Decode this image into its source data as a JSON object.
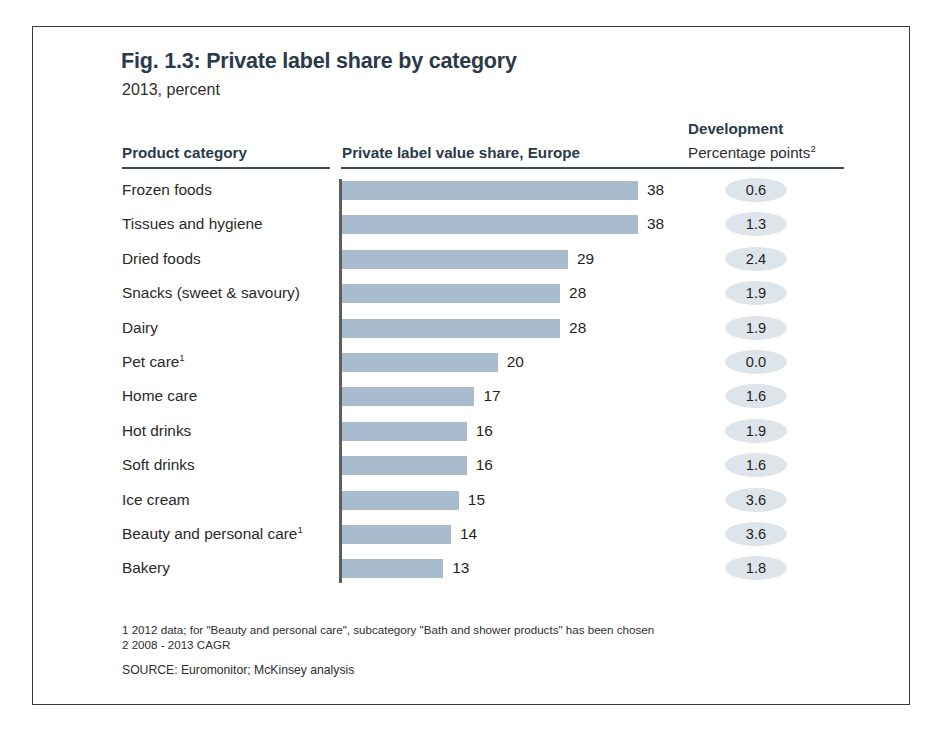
{
  "figure": {
    "title": "Fig. 1.3: Private label share by category",
    "subtitle": "2013, percent"
  },
  "headers": {
    "category": "Product category",
    "bars": "Private label value share, Europe",
    "development": "Development",
    "development_sub": "Percentage points",
    "development_sub_superscript": "2"
  },
  "footnotes": {
    "note1": "1 2012 data; for \"Beauty and personal care\", subcategory \"Bath and shower products\" has been chosen",
    "note2": "2 2008 - 2013 CAGR",
    "source": "SOURCE: Euromonitor; McKinsey analysis"
  },
  "colors": {
    "bar": "#a8bcce",
    "badge": "#dde4ea",
    "title": "#2b3a4a",
    "axis": "#5e5e5e",
    "frame": "#3a3a3a"
  },
  "chart_data": {
    "type": "bar",
    "orientation": "horizontal",
    "title": "Fig. 1.3: Private label share by category",
    "subtitle": "2013, percent",
    "xlabel": "Private label value share, Europe",
    "ylabel": "Product category",
    "xlim": [
      0,
      38
    ],
    "grid": false,
    "legend": null,
    "unit": "percent",
    "categories": [
      "Frozen foods",
      "Tissues and hygiene",
      "Dried foods",
      "Snacks (sweet & savoury)",
      "Dairy",
      "Pet care",
      "Home care",
      "Hot drinks",
      "Soft drinks",
      "Ice cream",
      "Beauty and personal care",
      "Bakery"
    ],
    "values": [
      38,
      38,
      29,
      28,
      28,
      20,
      17,
      16,
      16,
      15,
      14,
      13
    ],
    "development_values": [
      "0.6",
      "1.3",
      "2.4",
      "1.9",
      "1.9",
      "0.0",
      "1.6",
      "1.9",
      "1.6",
      "3.6",
      "3.6",
      "1.8"
    ],
    "rows": [
      {
        "label": "Frozen foods",
        "superscript": "",
        "value": 38,
        "value_label": "38",
        "development": "0.6"
      },
      {
        "label": "Tissues and hygiene",
        "superscript": "",
        "value": 38,
        "value_label": "38",
        "development": "1.3"
      },
      {
        "label": "Dried foods",
        "superscript": "",
        "value": 29,
        "value_label": "29",
        "development": "2.4"
      },
      {
        "label": "Snacks (sweet & savoury)",
        "superscript": "",
        "value": 28,
        "value_label": "28",
        "development": "1.9"
      },
      {
        "label": "Dairy",
        "superscript": "",
        "value": 28,
        "value_label": "28",
        "development": "1.9"
      },
      {
        "label": "Pet care",
        "superscript": "1",
        "value": 20,
        "value_label": "20",
        "development": "0.0"
      },
      {
        "label": "Home care",
        "superscript": "",
        "value": 17,
        "value_label": "17",
        "development": "1.6"
      },
      {
        "label": "Hot drinks",
        "superscript": "",
        "value": 16,
        "value_label": "16",
        "development": "1.9"
      },
      {
        "label": "Soft drinks",
        "superscript": "",
        "value": 16,
        "value_label": "16",
        "development": "1.6"
      },
      {
        "label": "Ice cream",
        "superscript": "",
        "value": 15,
        "value_label": "15",
        "development": "3.6"
      },
      {
        "label": "Beauty and personal care",
        "superscript": "1",
        "value": 14,
        "value_label": "14",
        "development": "3.6"
      },
      {
        "label": "Bakery",
        "superscript": "",
        "value": 13,
        "value_label": "13",
        "development": "1.8"
      }
    ]
  }
}
